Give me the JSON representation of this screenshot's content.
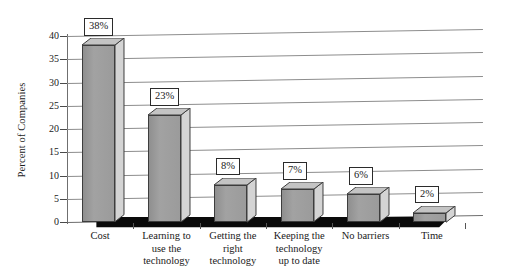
{
  "chart_data": {
    "type": "bar",
    "title": "",
    "subtitle": "",
    "xlabel": "",
    "ylabel": "Percent of Companies",
    "ylim": [
      0,
      40
    ],
    "yticks": [
      0,
      5,
      10,
      15,
      20,
      25,
      30,
      35,
      40
    ],
    "grid": true,
    "legend": false,
    "legend_position": "none",
    "three_d": true,
    "categories": [
      "Cost",
      "Learning to use the technology",
      "Getting the right technology",
      "Keeping the technology up to date",
      "No barriers",
      "Time"
    ],
    "category_lines": [
      [
        "Cost"
      ],
      [
        "Learning to",
        "use the",
        "technology"
      ],
      [
        "Getting the",
        "right",
        "technology"
      ],
      [
        "Keeping the",
        "technology",
        "up to date"
      ],
      [
        "No barriers"
      ],
      [
        "Time"
      ]
    ],
    "values": [
      38,
      23,
      8,
      7,
      6,
      2
    ],
    "data_labels": [
      "38%",
      "23%",
      "8%",
      "7%",
      "6%",
      "2%"
    ],
    "colors": {
      "bar_front": "#9a9a9a",
      "bar_side": "#d4d4d4",
      "bar_top": "#c4c4c4",
      "bar_outline": "#3d3d3d",
      "gridline": "#8d8d8d",
      "axis": "#4a4a4a",
      "floor": "#0a0a0a",
      "label_box_bg": "#ffffff",
      "label_box_border": "#2b2b2b",
      "text": "#1a1a1a",
      "background": "#ffffff"
    }
  }
}
